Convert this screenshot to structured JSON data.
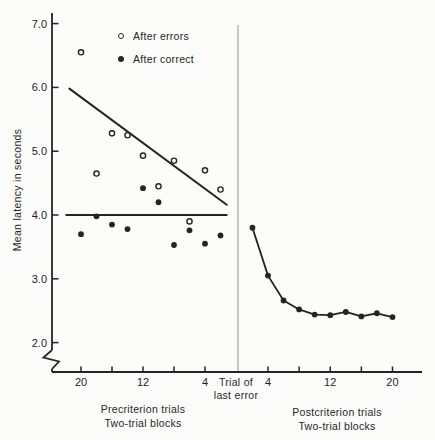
{
  "figure": {
    "background": "#fcfcfa",
    "ink": "#242424",
    "divider_color": "#8f8f8f",
    "ylabel": "Mean latency in seconds",
    "legend": {
      "items": [
        {
          "label": "After errors",
          "marker": "open-circle"
        },
        {
          "label": "After correct",
          "marker": "filled-circle"
        }
      ]
    },
    "divider_label": {
      "line1": "Trial of",
      "line2": "last error"
    },
    "captions": {
      "left": {
        "line1": "Precriterion trials",
        "line2": "Two-trial blocks"
      },
      "right": {
        "line1": "Postcriterion trials",
        "line2": "Two-trial blocks"
      }
    }
  },
  "y_axis": {
    "label": "Mean latency in seconds",
    "ticks": [
      7.0,
      6.0,
      5.0,
      4.0,
      3.0,
      2.0
    ],
    "tick_labels": [
      "7.0",
      "6.0",
      "5.0",
      "4.0",
      "3.0",
      "2.0"
    ],
    "range_shown": [
      2.0,
      7.0
    ],
    "axis_break": true
  },
  "chart_data": [
    {
      "type": "scatter",
      "panel": "precriterion",
      "xlabel": "Precriterion trials / Two-trial blocks",
      "ylabel": "Mean latency in seconds",
      "x_axis": {
        "ticks": [
          20,
          16,
          12,
          8,
          4
        ],
        "labeled_ticks": [
          20,
          12,
          4
        ],
        "direction": "decreasing-toward-divider"
      },
      "blocks": [
        20,
        18,
        16,
        14,
        12,
        10,
        8,
        6,
        4,
        2
      ],
      "series": [
        {
          "name": "After errors",
          "marker": "open-circle",
          "values": [
            6.55,
            4.65,
            5.28,
            5.25,
            4.93,
            4.45,
            4.85,
            3.9,
            4.7,
            4.4
          ]
        },
        {
          "name": "After correct",
          "marker": "filled-circle",
          "values": [
            3.7,
            3.98,
            3.85,
            3.78,
            4.42,
            4.2,
            3.53,
            3.76,
            3.55,
            3.68
          ]
        }
      ],
      "fit_lines": [
        {
          "series": "After errors",
          "x1_block": 21.5,
          "y1": 5.98,
          "x2_block": 1.2,
          "y2": 4.16
        },
        {
          "series": "After correct",
          "x1_block": 21.9,
          "y1": 4.0,
          "x2_block": 1.2,
          "y2": 4.0
        }
      ]
    },
    {
      "type": "line",
      "panel": "postcriterion",
      "xlabel": "Postcriterion trials / Two-trial blocks",
      "ylabel": "Mean latency in seconds",
      "x_axis": {
        "ticks": [
          4,
          8,
          12,
          16,
          20
        ],
        "labeled_ticks": [
          4,
          12,
          20
        ],
        "direction": "increasing"
      },
      "blocks": [
        2,
        4,
        6,
        8,
        10,
        12,
        14,
        16,
        18,
        20
      ],
      "series": [
        {
          "name": "Postcriterion latency",
          "marker": "filled-circle",
          "connected": true,
          "values": [
            3.8,
            3.05,
            2.66,
            2.52,
            2.44,
            2.43,
            2.48,
            2.41,
            2.46,
            2.4
          ]
        }
      ]
    }
  ]
}
